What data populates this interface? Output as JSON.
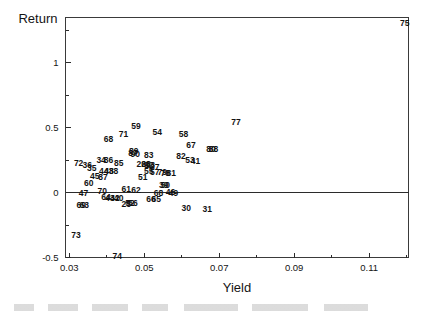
{
  "chart_data": {
    "type": "scatter",
    "title": "",
    "xlabel": "Yield",
    "ylabel": "Return",
    "xlim": [
      0.029,
      0.1205
    ],
    "ylim": [
      -0.5,
      1.35
    ],
    "grid": false,
    "legend": "none",
    "xticks": [
      0.03,
      0.05,
      0.07,
      0.09,
      0.11
    ],
    "xtick_labels": [
      "0.03",
      "0.05",
      "0.07",
      "0.09",
      "0.11"
    ],
    "xminorticks": [
      0.04,
      0.06,
      0.08,
      0.1,
      0.12
    ],
    "yticks": [
      -0.5,
      0,
      0.5,
      1
    ],
    "ytick_labels": [
      "-0.5",
      "0",
      "0.5",
      "1"
    ],
    "yminorticks": [
      -0.25,
      0.25,
      0.75,
      1.25
    ],
    "marker_style": "text-label",
    "points": [
      {
        "label": "75",
        "x": 0.1195,
        "y": 1.31
      },
      {
        "label": "77",
        "x": 0.0745,
        "y": 0.545
      },
      {
        "label": "59",
        "x": 0.0478,
        "y": 0.513
      },
      {
        "label": "54",
        "x": 0.0535,
        "y": 0.468
      },
      {
        "label": "58",
        "x": 0.0605,
        "y": 0.452
      },
      {
        "label": "71",
        "x": 0.0445,
        "y": 0.455
      },
      {
        "label": "68",
        "x": 0.0405,
        "y": 0.415
      },
      {
        "label": "67",
        "x": 0.0625,
        "y": 0.365
      },
      {
        "label": "80",
        "x": 0.0678,
        "y": 0.338
      },
      {
        "label": "88",
        "x": 0.0685,
        "y": 0.338
      },
      {
        "label": "89",
        "x": 0.0472,
        "y": 0.318
      },
      {
        "label": "87",
        "x": 0.047,
        "y": 0.306
      },
      {
        "label": "90",
        "x": 0.0476,
        "y": 0.3
      },
      {
        "label": "83",
        "x": 0.0512,
        "y": 0.288
      },
      {
        "label": "82",
        "x": 0.0598,
        "y": 0.282
      },
      {
        "label": "34",
        "x": 0.0385,
        "y": 0.252
      },
      {
        "label": "86",
        "x": 0.0405,
        "y": 0.25
      },
      {
        "label": "53",
        "x": 0.0622,
        "y": 0.25
      },
      {
        "label": "41",
        "x": 0.0637,
        "y": 0.246
      },
      {
        "label": "85",
        "x": 0.0432,
        "y": 0.228
      },
      {
        "label": "72",
        "x": 0.0325,
        "y": 0.225
      },
      {
        "label": "36",
        "x": 0.0348,
        "y": 0.215
      },
      {
        "label": "26",
        "x": 0.0492,
        "y": 0.222
      },
      {
        "label": "28",
        "x": 0.0505,
        "y": 0.22
      },
      {
        "label": "92",
        "x": 0.0512,
        "y": 0.215
      },
      {
        "label": "93",
        "x": 0.0516,
        "y": 0.212
      },
      {
        "label": "35",
        "x": 0.036,
        "y": 0.19
      },
      {
        "label": "37",
        "x": 0.0528,
        "y": 0.196
      },
      {
        "label": "44",
        "x": 0.0392,
        "y": 0.17
      },
      {
        "label": "48",
        "x": 0.0406,
        "y": 0.168
      },
      {
        "label": "38",
        "x": 0.0418,
        "y": 0.166
      },
      {
        "label": "55",
        "x": 0.0512,
        "y": 0.165
      },
      {
        "label": "57",
        "x": 0.0528,
        "y": 0.162
      },
      {
        "label": "79",
        "x": 0.0548,
        "y": 0.158
      },
      {
        "label": "78",
        "x": 0.0556,
        "y": 0.15
      },
      {
        "label": "81",
        "x": 0.0572,
        "y": 0.15
      },
      {
        "label": "45",
        "x": 0.0368,
        "y": 0.125
      },
      {
        "label": "87b",
        "x": 0.039,
        "y": 0.122
      },
      {
        "label": "51",
        "x": 0.0496,
        "y": 0.12
      },
      {
        "label": "60",
        "x": 0.0352,
        "y": 0.072
      },
      {
        "label": "39",
        "x": 0.0552,
        "y": 0.062
      },
      {
        "label": "50",
        "x": 0.0556,
        "y": 0.058
      },
      {
        "label": "61",
        "x": 0.0452,
        "y": 0.028
      },
      {
        "label": "62",
        "x": 0.0478,
        "y": 0.022
      },
      {
        "label": "70",
        "x": 0.0388,
        "y": 0.014
      },
      {
        "label": "47",
        "x": 0.0338,
        "y": 0.0
      },
      {
        "label": "68b",
        "x": 0.0538,
        "y": 0.0
      },
      {
        "label": "46",
        "x": 0.057,
        "y": 0.005
      },
      {
        "label": "49",
        "x": 0.0578,
        "y": 0.0
      },
      {
        "label": "64",
        "x": 0.0398,
        "y": -0.035
      },
      {
        "label": "43",
        "x": 0.0408,
        "y": -0.038
      },
      {
        "label": "42",
        "x": 0.0422,
        "y": -0.042
      },
      {
        "label": "40",
        "x": 0.0432,
        "y": -0.045
      },
      {
        "label": "66",
        "x": 0.0518,
        "y": -0.052
      },
      {
        "label": "65",
        "x": 0.0532,
        "y": -0.052
      },
      {
        "label": "69",
        "x": 0.0332,
        "y": -0.092
      },
      {
        "label": "63",
        "x": 0.034,
        "y": -0.092
      },
      {
        "label": "25",
        "x": 0.0452,
        "y": -0.088
      },
      {
        "label": "56",
        "x": 0.047,
        "y": -0.078
      },
      {
        "label": "52",
        "x": 0.0462,
        "y": -0.078
      },
      {
        "label": "30",
        "x": 0.0612,
        "y": -0.118
      },
      {
        "label": "31",
        "x": 0.0668,
        "y": -0.128
      },
      {
        "label": "73",
        "x": 0.0318,
        "y": -0.33
      },
      {
        "label": "74",
        "x": 0.0428,
        "y": -0.492
      }
    ]
  }
}
